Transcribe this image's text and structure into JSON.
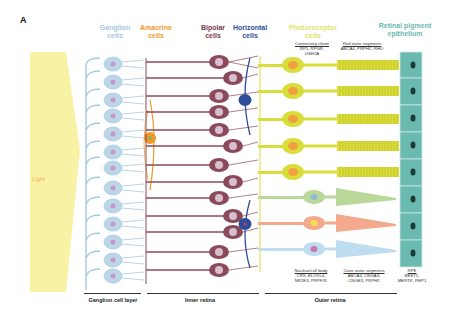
{
  "panel": {
    "letter": "A"
  },
  "light": {
    "label": "Light",
    "color": "#f8f3a4",
    "label_color": "#f0b25a"
  },
  "headers": {
    "ganglion": {
      "line1": "Ganglion",
      "line2": "cells",
      "color": "#a9c9df"
    },
    "amacrine": {
      "line1": "Amacrine",
      "line2": "cells",
      "color": "#ee9a2b"
    },
    "bipolar": {
      "line1": "Bipolar",
      "line2": "cells",
      "color": "#7a3a4c"
    },
    "horizontal": {
      "line1": "Horizontal",
      "line2": "cells",
      "color": "#2d4d9a"
    },
    "photoreceptor": {
      "line1": "Photoreceptor",
      "line2": "cells",
      "color": "#dfe36a"
    },
    "rpe": {
      "line1": "Retinal pigment",
      "line2": "epithelium",
      "color": "#6bbab0"
    }
  },
  "annotations": {
    "connecting_cilium": {
      "title": "Connecting cilium",
      "genes": [
        "RP1, RPGR,",
        "USH2A"
      ]
    },
    "rod_outer_segments": {
      "title": "Rod outer segments",
      "genes": [
        "ABCA4, PRPH2, RHO"
      ]
    },
    "nuclear_cell_body": {
      "title": "Nuclear/cell body",
      "genes": [
        "CRX, ELOVL4,",
        "NR2E3, PRPF31"
      ]
    },
    "cone_outer_segments": {
      "title": "Cone outer segments",
      "genes": [
        "ABCA4, CNGA3,",
        "CNGB3, PRPH2"
      ]
    },
    "rpe": {
      "title": "RPE",
      "genes": [
        "BEST1,",
        "MERTK, REP1"
      ]
    }
  },
  "layers": {
    "ganglion_cell_layer": "Ganglion cell layer",
    "inner_retina": "Inner retina",
    "outer_retina": "Outer retina"
  },
  "colors": {
    "ganglion": "#a9c9df",
    "ganglion_nucleus": "#c49ac8",
    "bipolar": "#8b4a5a",
    "bipolar_nucleus": "#d7bfd0",
    "amacrine": "#ee9a2b",
    "horizontal": "#2d4d9a",
    "rod": "#d9dd3a",
    "rod_nucleus": "#f0a040",
    "cone_green": "#b9d89a",
    "cone_red": "#f4a98f",
    "cone_blue": "#bfddf0",
    "rpe": "#6bbab0",
    "rpe_nucleus": "#1d3b36"
  }
}
